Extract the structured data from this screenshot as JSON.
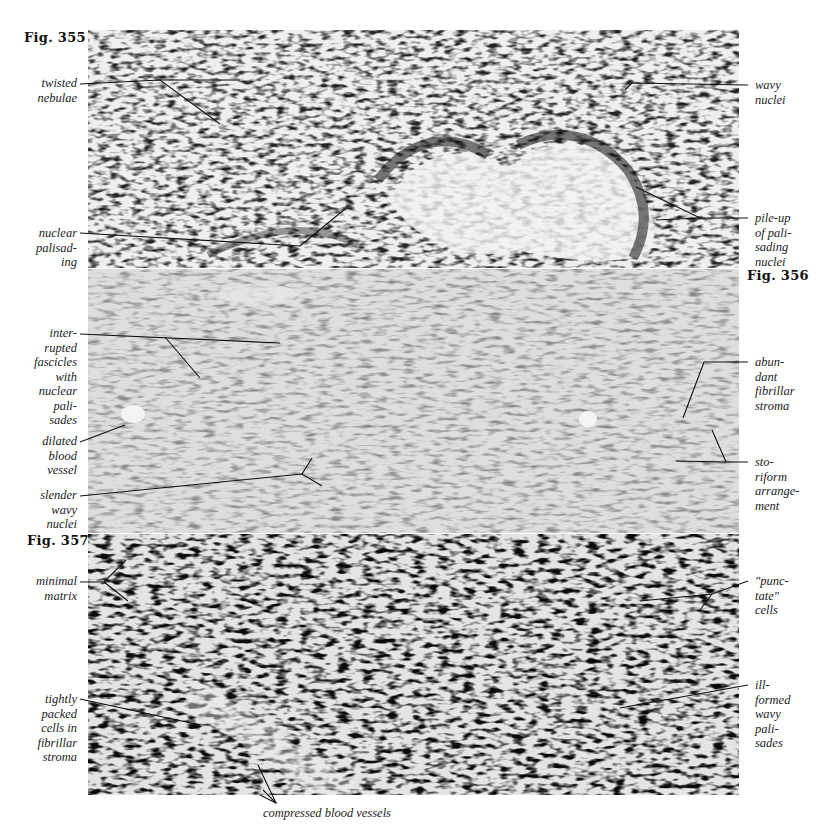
{
  "figures": [
    {
      "id": "fig355",
      "label_prefix": "Fig.",
      "number": "355",
      "panel": {
        "top": 30,
        "height": 238,
        "tone": "dark-speckled"
      },
      "annotations_left": [
        {
          "lines": [
            "twisted",
            "nebulae"
          ]
        },
        {
          "lines": [
            "nuclear",
            "palisad-",
            "ing"
          ]
        }
      ],
      "annotations_right": [
        {
          "lines": [
            "wavy",
            "nuclei"
          ]
        },
        {
          "lines": [
            "pile-up",
            "of pali-",
            "sading",
            "nuclei"
          ]
        }
      ]
    },
    {
      "id": "fig356",
      "label_prefix": "Fig.",
      "number": "356",
      "panel": {
        "top": 269,
        "height": 264,
        "tone": "medium-gray-fascicles"
      },
      "annotations_left": [
        {
          "lines": [
            "inter-",
            "rupted",
            "fascicles",
            "with",
            "nuclear",
            "pali-",
            "sades"
          ]
        },
        {
          "lines": [
            "dilated",
            "blood",
            "vessel"
          ]
        },
        {
          "lines": [
            "slender",
            "wavy",
            "nuclei"
          ]
        }
      ],
      "annotations_right": [
        {
          "lines": [
            "abun-",
            "dant",
            "fibrillar",
            "stroma"
          ]
        },
        {
          "lines": [
            "sto-",
            "riform",
            "arrange-",
            "ment"
          ]
        }
      ]
    },
    {
      "id": "fig357",
      "label_prefix": "Fig.",
      "number": "357",
      "panel": {
        "top": 534,
        "height": 261,
        "tone": "high-contrast-dense"
      },
      "annotations_left": [
        {
          "lines": [
            "minimal",
            "matrix"
          ]
        },
        {
          "lines": [
            "tightly",
            "packed",
            "cells in",
            "fibrillar",
            "stroma"
          ]
        }
      ],
      "annotations_right": [
        {
          "lines": [
            "\"punc-",
            "tate\"",
            "cells"
          ]
        },
        {
          "lines": [
            "ill-",
            "formed",
            "wavy",
            "pali-",
            "sades"
          ]
        }
      ],
      "annotation_bottom": "compressed blood vessels"
    }
  ],
  "colors": {
    "page": "#ffffff",
    "text": "#222222",
    "leader_line": "#111111",
    "panel_light": "#e9e9e9",
    "nucleus_dark": "#1c1c1c"
  }
}
